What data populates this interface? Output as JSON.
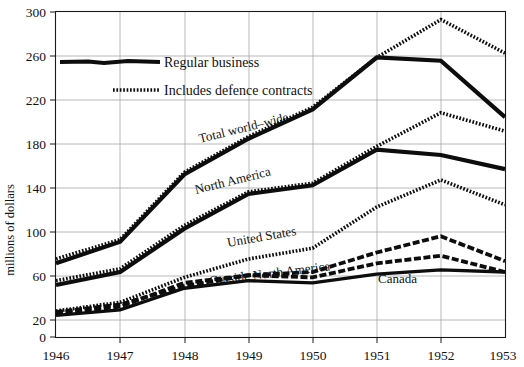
{
  "chart_data": {
    "type": "line",
    "title": "",
    "subtitle": "",
    "xlabel": "",
    "ylabel": "millions of dollars",
    "x": [
      1946,
      1947,
      1948,
      1949,
      1950,
      1951,
      1952,
      1953
    ],
    "xtick_labels": [
      "1946",
      "1947",
      "1948",
      "1949",
      "1950",
      "1951",
      "1952",
      "1953"
    ],
    "ytick_labels": [
      "0",
      "20",
      "60",
      "100",
      "140",
      "180",
      "220",
      "260",
      "300"
    ],
    "ytick_values": [
      0,
      20,
      60,
      100,
      140,
      180,
      220,
      260,
      300
    ],
    "ylim": [
      0,
      300
    ],
    "xlim": [
      1946,
      1953
    ],
    "grid": true,
    "legend_position": "top-left-inside",
    "legend": [
      {
        "label": "Regular business",
        "style": "solid"
      },
      {
        "label": "Includes defence contracts",
        "style": "dotted"
      }
    ],
    "series": [
      {
        "name": "Total world-wide",
        "style": "solid",
        "label_text": "Total world–wide",
        "values": [
          68,
          88,
          150,
          183,
          210,
          258,
          255,
          203
        ]
      },
      {
        "name": "Total world-wide (includes defence contracts)",
        "style": "dotted",
        "label_text": "",
        "values": [
          72,
          90,
          152,
          185,
          212,
          258,
          293,
          262
        ]
      },
      {
        "name": "North America",
        "style": "solid",
        "label_text": "North America",
        "values": [
          48,
          60,
          100,
          132,
          140,
          173,
          168,
          155
        ]
      },
      {
        "name": "North America (includes defence contracts)",
        "style": "dotted",
        "label_text": "",
        "values": [
          52,
          63,
          103,
          134,
          142,
          176,
          207,
          190
        ]
      },
      {
        "name": "United States (includes defence contracts)",
        "style": "dotted",
        "label_text": "United States",
        "values": [
          24,
          32,
          55,
          72,
          82,
          120,
          145,
          122
        ]
      },
      {
        "name": "United States",
        "style": "dashed",
        "label_text": "",
        "values": [
          23,
          30,
          47,
          57,
          60,
          78,
          93,
          70
        ]
      },
      {
        "name": "Outside North America",
        "style": "dashed",
        "label_text": "Outside North America",
        "values": [
          22,
          28,
          50,
          57,
          55,
          68,
          75,
          60
        ]
      },
      {
        "name": "Canada",
        "style": "solid",
        "label_text": "Canada",
        "values": [
          20,
          25,
          45,
          52,
          50,
          58,
          62,
          60
        ]
      }
    ],
    "annotations": [
      {
        "text": "Total world–wide",
        "x": 1949.0,
        "y": 198,
        "rotation": -14
      },
      {
        "text": "North America",
        "x": 1948.7,
        "y": 150,
        "rotation": -14
      },
      {
        "text": "United States",
        "x": 1949.1,
        "y": 100,
        "rotation": -10
      },
      {
        "text": "Outside North America",
        "x": 1948.9,
        "y": 72,
        "rotation": -7
      },
      {
        "text": "Canada",
        "x": 1951.5,
        "y": 72,
        "rotation": 0
      }
    ]
  }
}
